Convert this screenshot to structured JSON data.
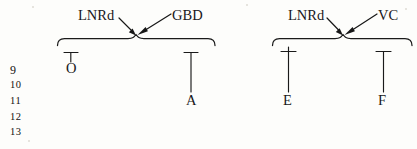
{
  "figure": {
    "type": "bracket-diagram",
    "background_color": "#fdfdfb",
    "ink_color": "#1a1a1a",
    "line_numbers": [
      "9",
      "10",
      "11",
      "12",
      "13"
    ],
    "groups": [
      {
        "id": "left-group",
        "annotations": [
          {
            "label": "LNRd",
            "x": 78,
            "y": 8
          },
          {
            "label": "GBD",
            "x": 172,
            "y": 8
          }
        ],
        "terminals": [
          {
            "label": "O",
            "x": 66,
            "y": 61
          },
          {
            "label": "A",
            "x": 186,
            "y": 93
          }
        ]
      },
      {
        "id": "right-group",
        "annotations": [
          {
            "label": "LNRd",
            "x": 288,
            "y": 8
          },
          {
            "label": "VC",
            "x": 378,
            "y": 8
          }
        ],
        "terminals": [
          {
            "label": "E",
            "x": 283,
            "y": 93
          },
          {
            "label": "F",
            "x": 378,
            "y": 93
          }
        ]
      }
    ]
  }
}
